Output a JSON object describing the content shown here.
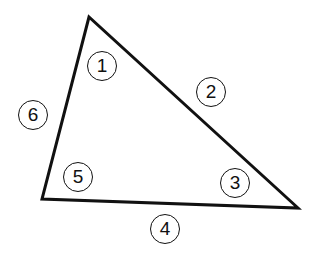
{
  "diagram": {
    "type": "triangle",
    "vertices": {
      "top": [
        89,
        17
      ],
      "bottom_left": [
        42,
        199
      ],
      "bottom_right": [
        298,
        208
      ]
    },
    "line_color": "#111111",
    "labels": [
      {
        "text": "1",
        "role": "angle-top",
        "x": 102,
        "y": 66
      },
      {
        "text": "2",
        "role": "side-right",
        "x": 211,
        "y": 92
      },
      {
        "text": "3",
        "role": "angle-bottom-right",
        "x": 235,
        "y": 183
      },
      {
        "text": "4",
        "role": "side-bottom",
        "x": 165,
        "y": 229
      },
      {
        "text": "5",
        "role": "angle-bottom-left",
        "x": 78,
        "y": 177
      },
      {
        "text": "6",
        "role": "side-left",
        "x": 33,
        "y": 115
      }
    ]
  }
}
